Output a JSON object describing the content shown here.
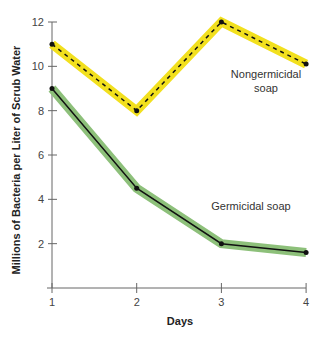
{
  "chart_data": {
    "type": "line",
    "title": "",
    "xlabel": "Days",
    "ylabel": "Millions of Bacteria per Liter of Scrub Water",
    "x": [
      1,
      2,
      3,
      4
    ],
    "x_ticks": [
      "1",
      "2",
      "3",
      "4"
    ],
    "y_ticks": [
      "2",
      "4",
      "6",
      "8",
      "10",
      "12"
    ],
    "ylim": [
      0,
      12
    ],
    "grid": false,
    "series": [
      {
        "name": "Nongermicidal soap",
        "values": [
          11,
          8,
          12,
          10.1
        ],
        "color": "#f2e01e",
        "line_style": "dashed"
      },
      {
        "name": "Germicidal soap",
        "values": [
          9,
          4.5,
          2,
          1.6
        ],
        "color": "#8dc07a",
        "line_style": "solid"
      }
    ],
    "annotations": [
      {
        "text_line1": "Nongermicidal",
        "text_line2": "soap"
      },
      {
        "text": "Germicidal soap"
      }
    ]
  }
}
